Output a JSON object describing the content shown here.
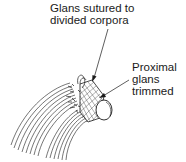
{
  "figure": {
    "type": "surgical illustration",
    "labels": [
      {
        "id": "glans-sutured",
        "lines": [
          "Glans sutured to",
          "divided corpora"
        ]
      },
      {
        "id": "proximal-glans",
        "lines": [
          "Proximal",
          "glans",
          "trimmed"
        ]
      }
    ],
    "colors": {
      "ink": "#1a1a1a",
      "background": "#ffffff"
    }
  }
}
